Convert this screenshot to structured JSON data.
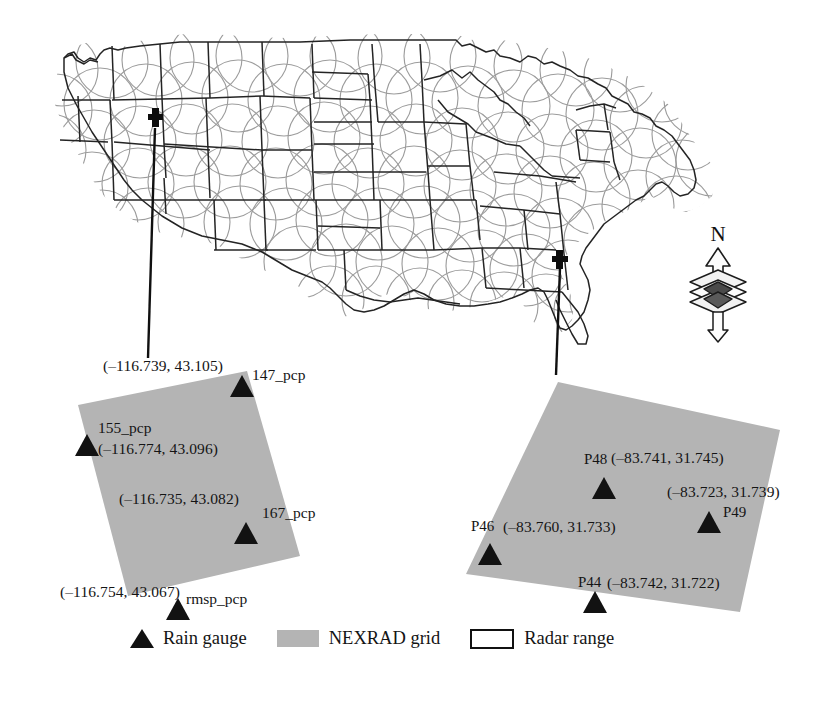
{
  "figure": {
    "type": "map-figure"
  },
  "map": {
    "region": "Continental United States",
    "radar_circle_color": "#9a9a9a",
    "state_border_color": "#222222",
    "markers": [
      {
        "name": "callout-marker-west",
        "glyph": "cross",
        "x": 155,
        "y": 122,
        "state": "Idaho"
      },
      {
        "name": "callout-marker-east",
        "glyph": "cross",
        "x": 560,
        "y": 262,
        "state": "Georgia"
      }
    ],
    "leaders": [
      {
        "name": "leader-line-west",
        "x1": 155,
        "y1": 128,
        "x2": 148,
        "y2": 358
      },
      {
        "name": "leader-line-east",
        "x1": 560,
        "y1": 268,
        "x2": 556,
        "y2": 375
      }
    ]
  },
  "compass": {
    "label": "N",
    "name": "north-arrow"
  },
  "insets": [
    {
      "id": "west-inset",
      "grid_label": "NEXRAD grid",
      "fill": "#b4b4b4",
      "corners": [
        [
          78,
          405
        ],
        [
          247,
          371
        ],
        [
          300,
          556
        ],
        [
          128,
          596
        ]
      ],
      "gauges": [
        {
          "id": "147_pcp",
          "label": "147_pcp",
          "coord": "(–116.739, 43.105)",
          "tri_x": 242,
          "tri_y": 375,
          "name_left": 252,
          "name_top": 367,
          "coord_left": 103,
          "coord_top": 358
        },
        {
          "id": "155_pcp",
          "label": "155_pcp",
          "coord": "(–116.774, 43.096)",
          "tri_x": 87,
          "tri_y": 434,
          "name_left": 98,
          "name_top": 420,
          "coord_left": 98,
          "coord_top": 441
        },
        {
          "id": "167_pcp",
          "label": "167_pcp",
          "coord": "(–116.735, 43.082)",
          "tri_x": 246,
          "tri_y": 522,
          "name_left": 262,
          "name_top": 505,
          "coord_left": 119,
          "coord_top": 491
        },
        {
          "id": "rmsp_pcp",
          "label": "rmsp_pcp",
          "coord": "(–116.754, 43.067)",
          "tri_x": 178,
          "tri_y": 598,
          "name_left": 186,
          "name_top": 591,
          "coord_left": 60,
          "coord_top": 584
        }
      ]
    },
    {
      "id": "east-inset",
      "grid_label": "NEXRAD grid",
      "fill": "#b4b4b4",
      "corners": [
        [
          558,
          382
        ],
        [
          780,
          430
        ],
        [
          740,
          612
        ],
        [
          466,
          574
        ]
      ],
      "gauges": [
        {
          "id": "P48",
          "label": "P48",
          "coord": "(–83.741, 31.745)",
          "tri_x": 604,
          "tri_y": 477,
          "name_left": 584,
          "name_top": 452,
          "coord_left": 611,
          "coord_top": 450
        },
        {
          "id": "P49",
          "label": "P49",
          "coord": "(–83.723, 31.739)",
          "tri_x": 709,
          "tri_y": 511,
          "name_left": 723,
          "name_top": 505,
          "coord_left": 667,
          "coord_top": 484
        },
        {
          "id": "P46",
          "label": "P46",
          "coord": "(–83.760, 31.733)",
          "tri_x": 490,
          "tri_y": 543,
          "name_left": 471,
          "name_top": 519,
          "coord_left": 503,
          "coord_top": 519
        },
        {
          "id": "P44",
          "label": "P44",
          "coord": "(–83.742, 31.722)",
          "tri_x": 595,
          "tri_y": 591,
          "name_left": 578,
          "name_top": 575,
          "coord_left": 607,
          "coord_top": 575
        }
      ]
    }
  ],
  "legend": {
    "items": [
      {
        "id": "rain-gauge",
        "label": "Rain gauge",
        "symbol": "triangle-icon",
        "color": "#111111"
      },
      {
        "id": "nexrad-grid",
        "label": "NEXRAD grid",
        "symbol": "gray-swatch-icon",
        "color": "#b4b4b4"
      },
      {
        "id": "radar-range",
        "label": "Radar range",
        "symbol": "rect-outline-icon",
        "color": "#ffffff"
      }
    ]
  },
  "chart_data": {
    "type": "map",
    "title": "",
    "radar_network": "NEXRAD",
    "insets": [
      {
        "name": "west-inset",
        "center_region": "Idaho",
        "gauges": [
          {
            "id": "147_pcp",
            "lon": -116.739,
            "lat": 43.105
          },
          {
            "id": "155_pcp",
            "lon": -116.774,
            "lat": 43.096
          },
          {
            "id": "167_pcp",
            "lon": -116.735,
            "lat": 43.082
          },
          {
            "id": "rmsp_pcp",
            "lon": -116.754,
            "lat": 43.067
          }
        ]
      },
      {
        "name": "east-inset",
        "center_region": "Georgia",
        "gauges": [
          {
            "id": "P48",
            "lon": -83.741,
            "lat": 31.745
          },
          {
            "id": "P49",
            "lon": -83.723,
            "lat": 31.739
          },
          {
            "id": "P46",
            "lon": -83.76,
            "lat": 31.733
          },
          {
            "id": "P44",
            "lon": -83.742,
            "lat": 31.722
          }
        ]
      }
    ],
    "legend": [
      "Rain gauge",
      "NEXRAD grid",
      "Radar range"
    ]
  }
}
